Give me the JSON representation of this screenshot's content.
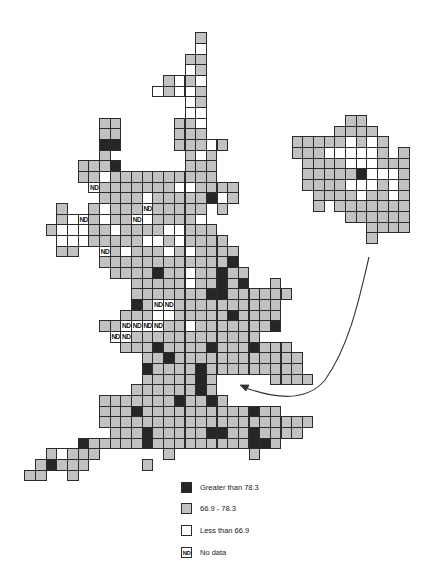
{
  "map": {
    "title": "Grid map of Great Britain",
    "cell_size": 10.67,
    "main_grid": {
      "origin_x": 24.4,
      "origin_y": 32.3,
      "rows": [
        "................L",
        "................W",
        "...............LL",
        "...............WL",
        ".............LWLW",
        "............WLWWL",
        "...............WL",
        "...............WW",
        ".......LL.....LLW",
        ".......LL.....LLL",
        ".......DD.....LLLWL",
        ".......L.......LWL",
        ".....LLLD......LLL",
        ".....LLWLLLLLLLLLL",
        "......NLLLLLLLWWLLLL",
        ".......LLLLWLLLLLDWL",
        "...L..LWLLLNLLLLL.L",
        "...LWNLWLLNWLLLLW",
        "..LWWWLLWLLLLWWLLL",
        "...WWWLLLLLWWLWLLLL",
        "...LL..NLWLLLWLWLLLL",
        ".......LLLLLLLLLLLLD",
        "........LLLLDLLWLLDLL",
        "..........LLLLLWLLDLD..L",
        "..........LLLLLLLDDLLLLLL",
        "..........DLNNLLLLLLLLLL",
        ".........LLLWWLLLLLDLLLL",
        ".......LLNNNNLLWLLLLLLLD",
        "........NNLLLLLLLLLLLL",
        ".........LLLDLLLLDLLLDLLL",
        "...........LLDLLLLLLLLLLLL",
        "...........DLLLLDLLLLLLLLL",
        "...........LLLLLDL.....LLLL",
        "..........LLLLLLDL",
        ".......LLLLLLLDLLDL",
        ".......LLLDLLLLLLLLLLDLL",
        ".......LLLLLLLLLLLLLLLLLLLL",
        "........LLLDLLLLLDDLLDLLLL",
        ".....DLLLLLDLLLLLLLLLDDL",
        "..LWLLL......L.......L",
        ".LDLLL.....L",
        "LL..L"
      ]
    },
    "inset_grid": {
      "origin_x": 291.7,
      "origin_y": 115,
      "rows": [
        ".....LL",
        "....LLLL",
        "LLLLLWLWL",
        "LLLWWWWWL.L",
        ".LLLLWWWLLL",
        ".LLLLLDWWWL",
        ".LLLLWWWLWL",
        "..LLLLWLLWL",
        "..L.LLLLLLL",
        ".....LLLLLL",
        ".......LLLL",
        ".......L"
      ]
    },
    "arrow": {
      "from": [
        369,
        257
      ],
      "to": [
        240,
        385
      ],
      "color": "#333333"
    }
  },
  "legend": {
    "items": [
      {
        "code": "D",
        "label": "Greater than 78.3",
        "color": "#262626"
      },
      {
        "code": "L",
        "label": "66.9 - 78.3",
        "color": "#c2c2c2"
      },
      {
        "code": "W",
        "label": "Less than 66.9",
        "color": "#ffffff"
      },
      {
        "code": "N",
        "label": "No data",
        "swatch_text": "ND",
        "color": "#ffffff"
      }
    ]
  }
}
